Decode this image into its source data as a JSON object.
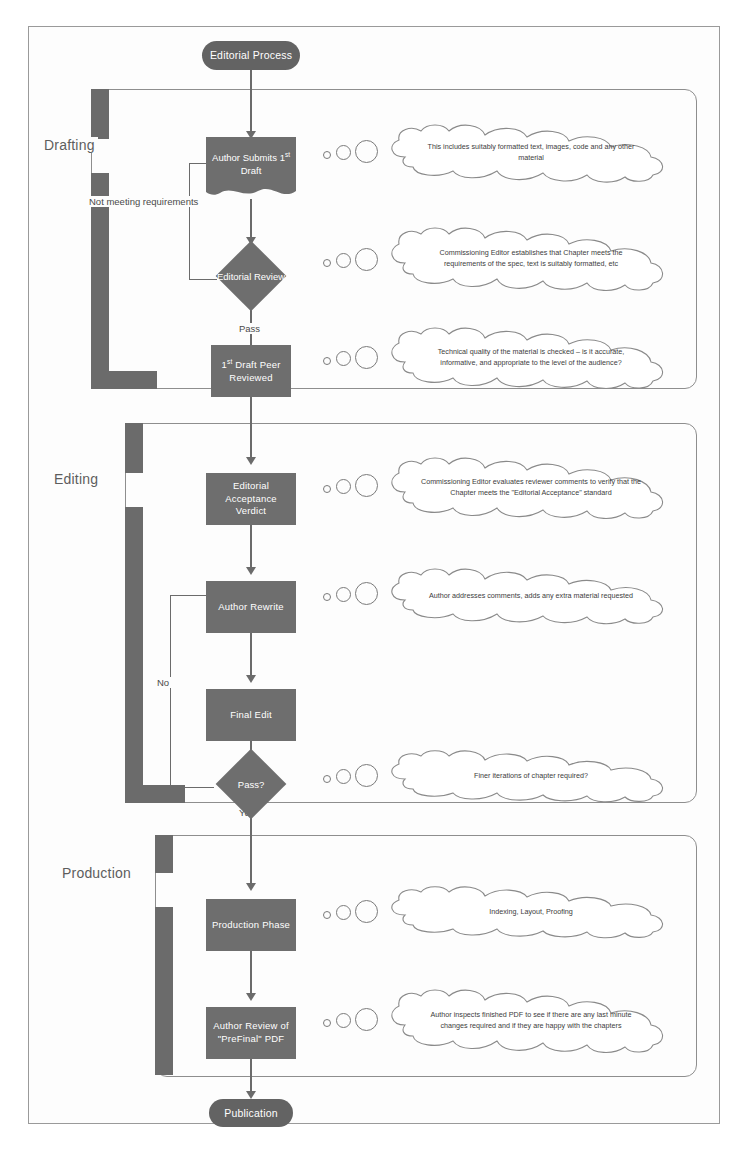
{
  "diagram": {
    "type": "flowchart",
    "title": "Editorial Process",
    "start_node": "Editorial Process",
    "end_node": "Publication",
    "phases": [
      {
        "label": "Drafting"
      },
      {
        "label": "Editing"
      },
      {
        "label": "Production"
      }
    ],
    "nodes": [
      {
        "id": "start",
        "label": "Editorial Process",
        "shape": "terminator"
      },
      {
        "id": "submit",
        "label_html": "Author Submits 1<sup>st</sup> Draft",
        "label": "Author Submits 1st Draft",
        "shape": "document"
      },
      {
        "id": "review",
        "label": "Editorial Review",
        "shape": "decision"
      },
      {
        "id": "peer",
        "label_html": "1<sup>st</sup> Draft Peer Reviewed",
        "label": "1st Draft Peer Reviewed",
        "shape": "process"
      },
      {
        "id": "verdict",
        "label": "Editorial Acceptance Verdict",
        "shape": "process"
      },
      {
        "id": "rewrite",
        "label": "Author Rewrite",
        "shape": "process"
      },
      {
        "id": "finaledit",
        "label": "Final Edit",
        "shape": "process"
      },
      {
        "id": "pass",
        "label": "Pass?",
        "shape": "decision"
      },
      {
        "id": "production",
        "label": "Production Phase",
        "shape": "process"
      },
      {
        "id": "authorreview",
        "label": "Author Review of \"PreFinal\" PDF",
        "shape": "process"
      },
      {
        "id": "end",
        "label": "Publication",
        "shape": "terminator"
      }
    ],
    "edge_labels": {
      "not_meeting": "Not meeting requirements",
      "pass": "Pass",
      "no": "No",
      "yes": "Yes"
    },
    "callouts": [
      {
        "for": "submit",
        "text": "This includes suitably formatted text, images, code and any other material"
      },
      {
        "for": "review",
        "text": "Commissioning Editor establishes that Chapter meets the requirements of the spec, text is suitably formatted, etc"
      },
      {
        "for": "peer",
        "text": "Technical quality of the material is checked – is it accurate, informative, and appropriate to the level of the audience?"
      },
      {
        "for": "verdict",
        "text": "Commissioning Editor evaluates reviewer comments to verify that the Chapter meets the \"Editorial Acceptance\" standard"
      },
      {
        "for": "rewrite",
        "text": "Author addresses comments, adds any extra material requested"
      },
      {
        "for": "pass",
        "text": "Finer iterations of chapter required?"
      },
      {
        "for": "production",
        "text": "Indexing, Layout, Proofing"
      },
      {
        "for": "authorreview",
        "text": "Author inspects finished PDF to see if there are any last minute changes required and if they are happy with the chapters"
      }
    ],
    "colors": {
      "node_fill": "#6e6e6e",
      "band": "#6b6b6b",
      "line": "#6b6b6b",
      "text_on_node": "#ffffff",
      "phase_label": "#5d5d5d",
      "callout_stroke": "#8a8a8a",
      "background": "#ffffff"
    }
  }
}
